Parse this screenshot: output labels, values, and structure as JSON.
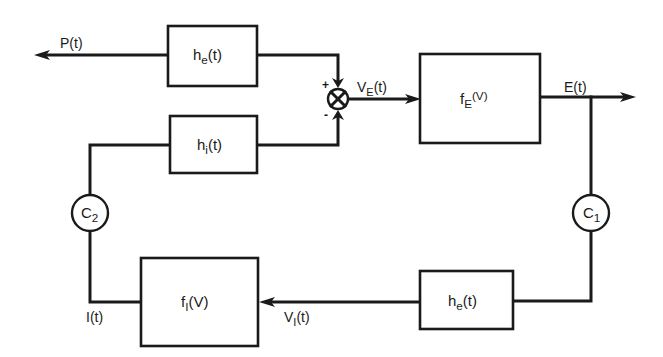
{
  "diagram": {
    "type": "block-diagram",
    "colors": {
      "line": "#1a1a1a",
      "background": "#ffffff"
    },
    "blocks": {
      "he_top": {
        "base": "h",
        "sub": "e",
        "arg": "(t)"
      },
      "hi": {
        "base": "h",
        "sub": "i",
        "arg": "(t)"
      },
      "fE": {
        "base": "f",
        "sub": "E",
        "arg": "(V)"
      },
      "fI": {
        "base": "f",
        "sub": "I",
        "arg": "(V)"
      },
      "he_bottom": {
        "base": "h",
        "sub": "e",
        "arg": "(t)"
      }
    },
    "summing_junction": {
      "symbol": "⊗",
      "plus": "+",
      "minus": "-"
    },
    "couplings": {
      "c1": {
        "base": "C",
        "sub": "1"
      },
      "c2": {
        "base": "C",
        "sub": "2"
      }
    },
    "signals": {
      "P": {
        "base": "P",
        "arg": "(t)"
      },
      "VE": {
        "base": "V",
        "sub": "E",
        "arg": "(t)"
      },
      "E": {
        "base": "E",
        "arg": "(t)"
      },
      "VI": {
        "base": "V",
        "sub": "I",
        "arg": "(t)"
      },
      "I": {
        "base": "I",
        "arg": "(t)"
      }
    },
    "connections": [
      {
        "from": "P",
        "to": "he_top"
      },
      {
        "from": "he_top",
        "to": "summing_junction",
        "sign": "+"
      },
      {
        "from": "hi",
        "to": "summing_junction",
        "sign": "-"
      },
      {
        "from": "summing_junction",
        "to": "fE",
        "signal": "VE"
      },
      {
        "from": "fE",
        "to": "output",
        "signal": "E"
      },
      {
        "from": "fE",
        "to": "c1"
      },
      {
        "from": "c1",
        "to": "he_bottom"
      },
      {
        "from": "he_bottom",
        "to": "fI",
        "signal": "VI"
      },
      {
        "from": "fI",
        "to": "c2",
        "signal": "I"
      },
      {
        "from": "c2",
        "to": "hi"
      }
    ]
  }
}
